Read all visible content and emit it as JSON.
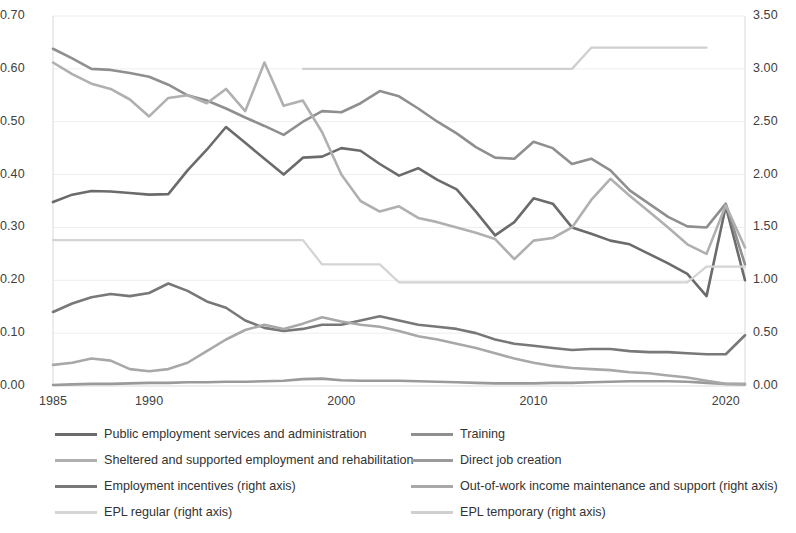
{
  "chart_data": {
    "type": "line",
    "title": "",
    "subtitle": "",
    "xlabel": "",
    "ylabel": "",
    "y2label": "",
    "grid": true,
    "legend_position": "bottom",
    "x": [
      1985,
      1986,
      1987,
      1988,
      1989,
      1990,
      1991,
      1992,
      1993,
      1994,
      1995,
      1996,
      1997,
      1998,
      1999,
      2000,
      2001,
      2002,
      2003,
      2004,
      2005,
      2006,
      2007,
      2008,
      2009,
      2010,
      2011,
      2012,
      2013,
      2014,
      2015,
      2016,
      2017,
      2018,
      2019,
      2020,
      2021
    ],
    "xlim": [
      1985,
      2021
    ],
    "xticks": [
      1985,
      1990,
      2000,
      2010,
      2020
    ],
    "xtick_labels": [
      "1985",
      "1990",
      "2000",
      "2010",
      "2020"
    ],
    "ylim": [
      0.0,
      0.7
    ],
    "yticks": [
      0.0,
      0.1,
      0.2,
      0.3,
      0.4,
      0.5,
      0.6,
      0.7
    ],
    "ytick_labels": [
      "0.00",
      "0.10",
      "0.20",
      "0.30",
      "0.40",
      "0.50",
      "0.60",
      "0.70"
    ],
    "y2lim": [
      0.0,
      3.5
    ],
    "y2ticks": [
      0.0,
      0.5,
      1.0,
      1.5,
      2.0,
      2.5,
      3.0,
      3.5
    ],
    "y2tick_labels": [
      "0.00",
      "0.50",
      "1.00",
      "1.50",
      "2.00",
      "2.50",
      "3.00",
      "3.50"
    ],
    "series": [
      {
        "name": "Public employment services and administration",
        "axis": "left",
        "color": "#6b6b6b",
        "width": 2.6,
        "values": [
          0.348,
          0.362,
          0.369,
          0.368,
          0.365,
          0.362,
          0.363,
          0.408,
          0.447,
          0.49,
          0.46,
          0.43,
          0.4,
          0.432,
          0.434,
          0.45,
          0.445,
          0.42,
          0.398,
          0.412,
          0.39,
          0.372,
          0.33,
          0.285,
          0.31,
          0.355,
          0.345,
          0.3,
          0.288,
          0.275,
          0.268,
          0.25,
          0.232,
          0.212,
          0.17,
          0.34,
          0.2
        ]
      },
      {
        "name": "Training",
        "axis": "left",
        "color": "#8f8f8f",
        "width": 2.6,
        "values": [
          0.638,
          0.62,
          0.6,
          0.598,
          0.592,
          0.585,
          0.57,
          0.55,
          0.54,
          0.525,
          0.508,
          0.492,
          0.475,
          0.5,
          0.52,
          0.518,
          0.535,
          0.558,
          0.548,
          0.525,
          0.5,
          0.478,
          0.452,
          0.432,
          0.43,
          0.462,
          0.45,
          0.42,
          0.43,
          0.408,
          0.37,
          0.345,
          0.32,
          0.302,
          0.3,
          0.345,
          0.23
        ]
      },
      {
        "name": "Sheltered and supported employment and rehabilitation",
        "axis": "left",
        "color": "#b0b0b0",
        "width": 2.6,
        "values": [
          0.612,
          0.59,
          0.572,
          0.562,
          0.542,
          0.51,
          0.545,
          0.55,
          0.535,
          0.562,
          0.52,
          0.612,
          0.53,
          0.54,
          0.48,
          0.4,
          0.35,
          0.33,
          0.34,
          0.318,
          0.31,
          0.3,
          0.29,
          0.278,
          0.24,
          0.275,
          0.28,
          0.3,
          0.352,
          0.392,
          0.36,
          0.33,
          0.3,
          0.268,
          0.25,
          0.342,
          0.262
        ]
      },
      {
        "name": "Direct job creation",
        "axis": "left",
        "color": "#9a9a9a",
        "width": 2.6,
        "values": [
          0.002,
          0.003,
          0.004,
          0.004,
          0.005,
          0.006,
          0.006,
          0.007,
          0.007,
          0.008,
          0.008,
          0.009,
          0.01,
          0.013,
          0.014,
          0.011,
          0.01,
          0.01,
          0.01,
          0.009,
          0.008,
          0.007,
          0.006,
          0.005,
          0.005,
          0.005,
          0.006,
          0.006,
          0.007,
          0.008,
          0.009,
          0.009,
          0.009,
          0.008,
          0.006,
          0.004,
          0.003
        ]
      },
      {
        "name": "Employment incentives (right axis)",
        "axis": "right",
        "color": "#787878",
        "width": 2.6,
        "values": [
          0.7,
          0.78,
          0.84,
          0.87,
          0.85,
          0.88,
          0.97,
          0.9,
          0.8,
          0.74,
          0.62,
          0.55,
          0.52,
          0.54,
          0.58,
          0.58,
          0.62,
          0.66,
          0.62,
          0.58,
          0.56,
          0.54,
          0.5,
          0.44,
          0.4,
          0.38,
          0.36,
          0.34,
          0.35,
          0.35,
          0.33,
          0.32,
          0.32,
          0.31,
          0.3,
          0.3,
          0.48
        ]
      },
      {
        "name": "Out-of-work income maintenance and support (right axis)",
        "axis": "right",
        "color": "#a8a8a8",
        "width": 2.6,
        "values": [
          0.2,
          0.22,
          0.26,
          0.24,
          0.16,
          0.14,
          0.16,
          0.22,
          0.33,
          0.44,
          0.53,
          0.58,
          0.54,
          0.59,
          0.65,
          0.61,
          0.58,
          0.56,
          0.52,
          0.47,
          0.44,
          0.4,
          0.36,
          0.31,
          0.26,
          0.22,
          0.19,
          0.17,
          0.16,
          0.15,
          0.13,
          0.12,
          0.1,
          0.08,
          0.05,
          0.02,
          0.02
        ]
      },
      {
        "name": "EPL regular (right axis)",
        "axis": "right",
        "color": "#d4d4d4",
        "width": 2.3,
        "values": [
          1.38,
          1.38,
          1.38,
          1.38,
          1.38,
          1.38,
          1.38,
          1.38,
          1.38,
          1.38,
          1.38,
          1.38,
          1.38,
          1.38,
          1.15,
          1.15,
          1.15,
          1.15,
          0.98,
          0.98,
          0.98,
          0.98,
          0.98,
          0.98,
          0.98,
          0.98,
          0.98,
          0.98,
          0.98,
          0.98,
          0.98,
          0.98,
          0.98,
          0.98,
          1.13,
          1.13,
          1.13
        ]
      },
      {
        "name": "EPL temporary (right axis)",
        "axis": "right",
        "color": "#cfcfcf",
        "width": 2.3,
        "values": [
          null,
          null,
          null,
          null,
          null,
          null,
          null,
          null,
          null,
          null,
          null,
          null,
          null,
          3.0,
          3.0,
          3.0,
          3.0,
          3.0,
          3.0,
          3.0,
          3.0,
          3.0,
          3.0,
          3.0,
          3.0,
          3.0,
          3.0,
          3.0,
          3.2,
          3.2,
          3.2,
          3.2,
          3.2,
          3.2,
          3.2,
          null,
          null
        ]
      }
    ],
    "legend": [
      {
        "label": "Public employment services and administration",
        "color": "#6b6b6b"
      },
      {
        "label": "Training",
        "color": "#8f8f8f"
      },
      {
        "label": "Sheltered and supported employment and rehabilitation",
        "color": "#b0b0b0"
      },
      {
        "label": "Direct job creation",
        "color": "#9a9a9a"
      },
      {
        "label": "Employment incentives (right axis)",
        "color": "#787878"
      },
      {
        "label": "Out-of-work income maintenance and support (right axis)",
        "color": "#a8a8a8"
      },
      {
        "label": "EPL regular (right axis)",
        "color": "#d4d4d4"
      },
      {
        "label": "EPL temporary (right axis)",
        "color": "#cfcfcf"
      }
    ],
    "colors": {
      "gridline": "#eeeeee",
      "axis_line": "#d9d9d9",
      "tick_text": "#404040"
    }
  }
}
